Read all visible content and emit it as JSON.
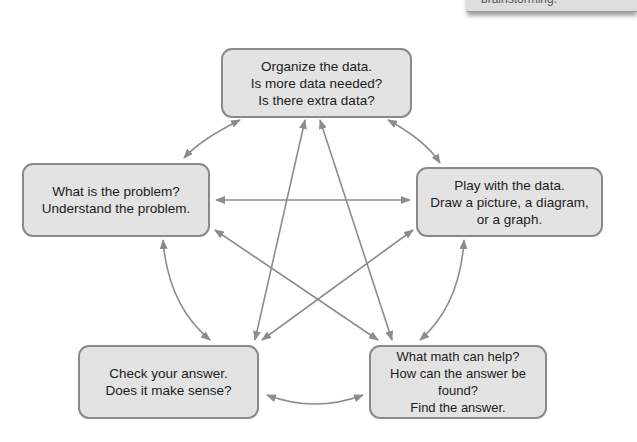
{
  "corner_card": {
    "text": "brainstorming."
  },
  "nodes": {
    "top": {
      "lines": [
        "Organize the data.",
        "Is more data needed?",
        "Is there extra data?"
      ]
    },
    "left": {
      "lines": [
        "What is the problem?",
        "Understand the problem."
      ]
    },
    "right": {
      "lines": [
        "Play with the data.",
        "Draw a picture, a diagram,",
        "or a graph."
      ]
    },
    "bottom_left": {
      "lines": [
        "Check your answer.",
        "Does it make sense?"
      ]
    },
    "bottom_right": {
      "lines": [
        "What math can help?",
        "How can the answer be found?",
        "Find the answer."
      ]
    }
  },
  "colors": {
    "box_fill": "#e3e3e3",
    "box_border": "#8a8a8a",
    "arrow": "#8c8c8c"
  }
}
